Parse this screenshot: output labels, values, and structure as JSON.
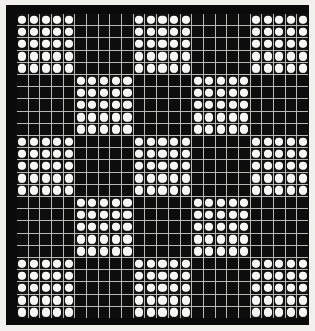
{
  "figure": {
    "title": "",
    "caption": "",
    "background_color": "#f2f0ec",
    "plate_color": "#0a0a0a",
    "grid_line_color": "#c9c9c4",
    "cell_off_color": "#0d0d0d",
    "dot_color": "#f6f6f2"
  },
  "chart_data": {
    "type": "heatmap",
    "title": "",
    "subtitle": "",
    "xlabel": "",
    "ylabel": "",
    "rows": 25,
    "cols": 25,
    "grid": true,
    "legend": "none",
    "value_labels": {
      "0": "empty cell",
      "1": "dot cell"
    },
    "colormap": [
      "#0d0d0d",
      "#f6f6f2"
    ],
    "construction": "Kronecker self-product of a 5x5 checkerboard seed, giving a 25x25 self-similar dot lattice.",
    "seed": [
      [
        1,
        0,
        1,
        0,
        1
      ],
      [
        0,
        1,
        0,
        1,
        0
      ],
      [
        1,
        0,
        1,
        0,
        1
      ],
      [
        0,
        1,
        0,
        1,
        0
      ],
      [
        1,
        0,
        1,
        0,
        1
      ]
    ],
    "matrix": [
      [
        1,
        1,
        1,
        1,
        1,
        0,
        0,
        0,
        0,
        0,
        1,
        1,
        1,
        1,
        1,
        0,
        0,
        0,
        0,
        0,
        1,
        1,
        1,
        1,
        1
      ],
      [
        1,
        1,
        1,
        1,
        1,
        0,
        0,
        0,
        0,
        0,
        1,
        1,
        1,
        1,
        1,
        0,
        0,
        0,
        0,
        0,
        1,
        1,
        1,
        1,
        1
      ],
      [
        1,
        1,
        1,
        1,
        1,
        0,
        0,
        0,
        0,
        0,
        1,
        1,
        1,
        1,
        1,
        0,
        0,
        0,
        0,
        0,
        1,
        1,
        1,
        1,
        1
      ],
      [
        1,
        1,
        1,
        1,
        1,
        0,
        0,
        0,
        0,
        0,
        1,
        1,
        1,
        1,
        1,
        0,
        0,
        0,
        0,
        0,
        1,
        1,
        1,
        1,
        1
      ],
      [
        1,
        1,
        1,
        1,
        1,
        0,
        0,
        0,
        0,
        0,
        1,
        1,
        1,
        1,
        1,
        0,
        0,
        0,
        0,
        0,
        1,
        1,
        1,
        1,
        1
      ],
      [
        0,
        0,
        0,
        0,
        0,
        1,
        1,
        1,
        1,
        1,
        0,
        0,
        0,
        0,
        0,
        1,
        1,
        1,
        1,
        1,
        0,
        0,
        0,
        0,
        0
      ],
      [
        0,
        0,
        0,
        0,
        0,
        1,
        1,
        1,
        1,
        1,
        0,
        0,
        0,
        0,
        0,
        1,
        1,
        1,
        1,
        1,
        0,
        0,
        0,
        0,
        0
      ],
      [
        0,
        0,
        0,
        0,
        0,
        1,
        1,
        1,
        1,
        1,
        0,
        0,
        0,
        0,
        0,
        1,
        1,
        1,
        1,
        1,
        0,
        0,
        0,
        0,
        0
      ],
      [
        0,
        0,
        0,
        0,
        0,
        1,
        1,
        1,
        1,
        1,
        0,
        0,
        0,
        0,
        0,
        1,
        1,
        1,
        1,
        1,
        0,
        0,
        0,
        0,
        0
      ],
      [
        0,
        0,
        0,
        0,
        0,
        1,
        1,
        1,
        1,
        1,
        0,
        0,
        0,
        0,
        0,
        1,
        1,
        1,
        1,
        1,
        0,
        0,
        0,
        0,
        0
      ],
      [
        1,
        1,
        1,
        1,
        1,
        0,
        0,
        0,
        0,
        0,
        1,
        1,
        1,
        1,
        1,
        0,
        0,
        0,
        0,
        0,
        1,
        1,
        1,
        1,
        1
      ],
      [
        1,
        1,
        1,
        1,
        1,
        0,
        0,
        0,
        0,
        0,
        1,
        1,
        1,
        1,
        1,
        0,
        0,
        0,
        0,
        0,
        1,
        1,
        1,
        1,
        1
      ],
      [
        1,
        1,
        1,
        1,
        1,
        0,
        0,
        0,
        0,
        0,
        1,
        1,
        1,
        1,
        1,
        0,
        0,
        0,
        0,
        0,
        1,
        1,
        1,
        1,
        1
      ],
      [
        1,
        1,
        1,
        1,
        1,
        0,
        0,
        0,
        0,
        0,
        1,
        1,
        1,
        1,
        1,
        0,
        0,
        0,
        0,
        0,
        1,
        1,
        1,
        1,
        1
      ],
      [
        1,
        1,
        1,
        1,
        1,
        0,
        0,
        0,
        0,
        0,
        1,
        1,
        1,
        1,
        1,
        0,
        0,
        0,
        0,
        0,
        1,
        1,
        1,
        1,
        1
      ],
      [
        0,
        0,
        0,
        0,
        0,
        1,
        1,
        1,
        1,
        1,
        0,
        0,
        0,
        0,
        0,
        1,
        1,
        1,
        1,
        1,
        0,
        0,
        0,
        0,
        0
      ],
      [
        0,
        0,
        0,
        0,
        0,
        1,
        1,
        1,
        1,
        1,
        0,
        0,
        0,
        0,
        0,
        1,
        1,
        1,
        1,
        1,
        0,
        0,
        0,
        0,
        0
      ],
      [
        0,
        0,
        0,
        0,
        0,
        1,
        1,
        1,
        1,
        1,
        0,
        0,
        0,
        0,
        0,
        1,
        1,
        1,
        1,
        1,
        0,
        0,
        0,
        0,
        0
      ],
      [
        0,
        0,
        0,
        0,
        0,
        1,
        1,
        1,
        1,
        1,
        0,
        0,
        0,
        0,
        0,
        1,
        1,
        1,
        1,
        1,
        0,
        0,
        0,
        0,
        0
      ],
      [
        0,
        0,
        0,
        0,
        0,
        1,
        1,
        1,
        1,
        1,
        0,
        0,
        0,
        0,
        0,
        1,
        1,
        1,
        1,
        1,
        0,
        0,
        0,
        0,
        0
      ],
      [
        1,
        1,
        1,
        1,
        1,
        0,
        0,
        0,
        0,
        0,
        1,
        1,
        1,
        1,
        1,
        0,
        0,
        0,
        0,
        0,
        1,
        1,
        1,
        1,
        1
      ],
      [
        1,
        1,
        1,
        1,
        1,
        0,
        0,
        0,
        0,
        0,
        1,
        1,
        1,
        1,
        1,
        0,
        0,
        0,
        0,
        0,
        1,
        1,
        1,
        1,
        1
      ],
      [
        1,
        1,
        1,
        1,
        1,
        0,
        0,
        0,
        0,
        0,
        1,
        1,
        1,
        1,
        1,
        0,
        0,
        0,
        0,
        0,
        1,
        1,
        1,
        1,
        1
      ],
      [
        1,
        1,
        1,
        1,
        1,
        0,
        0,
        0,
        0,
        0,
        1,
        1,
        1,
        1,
        1,
        0,
        0,
        0,
        0,
        0,
        1,
        1,
        1,
        1,
        1
      ],
      [
        1,
        1,
        1,
        1,
        1,
        0,
        0,
        0,
        0,
        0,
        1,
        1,
        1,
        1,
        1,
        0,
        0,
        0,
        0,
        0,
        1,
        1,
        1,
        1,
        1
      ]
    ]
  }
}
